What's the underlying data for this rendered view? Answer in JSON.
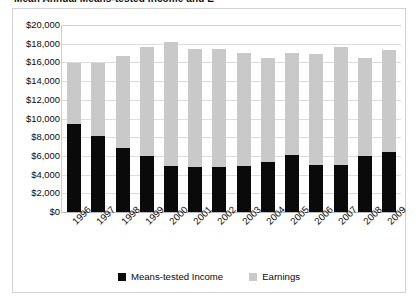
{
  "title_sliver": "Mean Annual Means-tested Income and Earnings",
  "chart_data": {
    "type": "bar",
    "subtype": "stacked-column",
    "title": "Mean Annual Means-tested Income and Earnings",
    "xlabel": "",
    "ylabel": "",
    "ylim": [
      0,
      20000
    ],
    "ytick_step": 2000,
    "ytick_labels": [
      "$20,000",
      "$18,000",
      "$16,000",
      "$14,000",
      "$12,000",
      "$10,000",
      "$8,000",
      "$6,000",
      "$4,000",
      "$2,000",
      "$0"
    ],
    "ytick_values": [
      20000,
      18000,
      16000,
      14000,
      12000,
      10000,
      8000,
      6000,
      4000,
      2000,
      0
    ],
    "grid": true,
    "legend_position": "bottom",
    "categories": [
      "1996",
      "1997",
      "1998",
      "1999",
      "2000",
      "2001",
      "2002",
      "2003",
      "2004",
      "2005",
      "2006",
      "2007",
      "2008",
      "2009"
    ],
    "series": [
      {
        "name": "Means-tested Income",
        "color": "#0a0a0a",
        "values": [
          9400,
          8100,
          6900,
          6000,
          4900,
          4800,
          4800,
          4900,
          5300,
          6100,
          5000,
          5000,
          6000,
          6400
        ]
      },
      {
        "name": "Earnings",
        "color": "#c9c9c9",
        "values": [
          6500,
          7800,
          9800,
          11600,
          13300,
          12600,
          12600,
          12100,
          11200,
          10900,
          11900,
          12600,
          10500,
          10900
        ]
      }
    ],
    "stack_totals": [
      15900,
      15900,
      16700,
      17600,
      18200,
      17400,
      17400,
      17000,
      16500,
      17000,
      16900,
      17600,
      16500,
      17300
    ]
  },
  "legend": {
    "items": [
      {
        "label": "Means-tested Income",
        "swatch": "means"
      },
      {
        "label": "Earnings",
        "swatch": "earn"
      }
    ]
  },
  "colors": {
    "means_tested": "#0a0a0a",
    "earnings": "#c9c9c9",
    "gridline": "#dcdcdc",
    "frame": "#d2d2d2",
    "text": "#0b0b0b"
  }
}
